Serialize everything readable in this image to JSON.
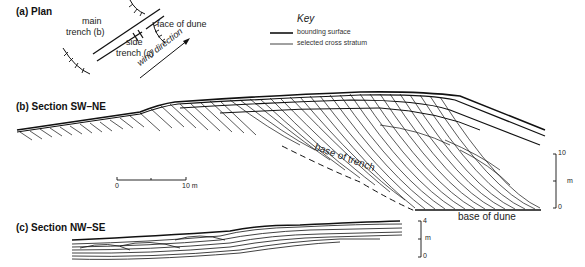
{
  "panels": {
    "plan": {
      "title": "(a) Plan",
      "labels": {
        "main_trench": [
          "main",
          "trench (b)"
        ],
        "side_trench": [
          "side",
          "trench (c)"
        ],
        "face_of_dune": "face of dune",
        "wind_direction": "wind direction"
      }
    },
    "section_b": {
      "title": "(b) Section SW–NE",
      "labels": {
        "base_of_trench": "base of trench",
        "base_of_dune": "base of dune"
      },
      "horizontal_scale": {
        "start": "0",
        "end": "10 m"
      },
      "vertical_scale": {
        "top": "10",
        "unit": "m",
        "bottom": "0"
      }
    },
    "section_c": {
      "title": "(c) Section NW–SE",
      "vertical_scale": {
        "top": "4",
        "unit": "m",
        "bottom": "0"
      }
    }
  },
  "key": {
    "title": "Key",
    "items": [
      {
        "label": "bounding surface",
        "style": "thick"
      },
      {
        "label": "selected cross stratum",
        "style": "thin"
      }
    ]
  },
  "colors": {
    "line": "#111111",
    "background": "#ffffff"
  }
}
